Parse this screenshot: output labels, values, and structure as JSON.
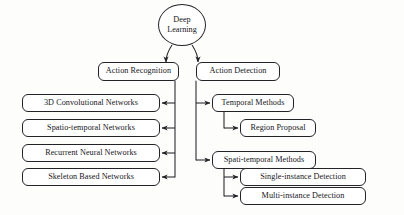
{
  "diagram": {
    "root": {
      "id": "deep-learning",
      "label": "Deep Learning",
      "shape": "oval"
    },
    "branches": [
      {
        "id": "action-recognition",
        "label": "Action Recognition",
        "children": [
          {
            "id": "3d-convolutional-networks",
            "label": "3D Convolutional Networks"
          },
          {
            "id": "spatio-temporal-networks",
            "label": "Spatio-temporal Networks"
          },
          {
            "id": "recurrent-neural-networks",
            "label": "Recurrent Neural Networks"
          },
          {
            "id": "skeleton-based-networks",
            "label": "Skeleton Based Networks"
          }
        ]
      },
      {
        "id": "action-detection",
        "label": "Action Detection",
        "children": [
          {
            "id": "temporal-methods",
            "label": "Temporal Methods",
            "children": [
              {
                "id": "region-proposal",
                "label": "Region Proposal"
              }
            ]
          },
          {
            "id": "spati-temporal-methods",
            "label": "Spati-temporal Methods",
            "children": [
              {
                "id": "single-instance-detection",
                "label": "Single-instance Detection"
              },
              {
                "id": "multi-instance-detection",
                "label": "Multi-instance Detection"
              }
            ]
          }
        ]
      }
    ],
    "colors": {
      "background": "#fdfdfc",
      "node_fill": "#ffffff",
      "stroke": "#232327",
      "text": "#16161a"
    }
  }
}
